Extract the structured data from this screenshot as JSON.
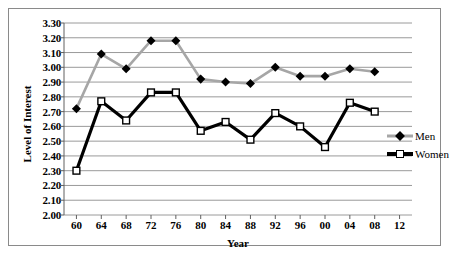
{
  "chart_data": {
    "type": "line",
    "title": "",
    "xlabel": "Year",
    "ylabel": "Level of Interest",
    "x": [
      60,
      64,
      68,
      72,
      76,
      80,
      84,
      88,
      92,
      96,
      0,
      4,
      8
    ],
    "tick_labels": [
      "60",
      "64",
      "68",
      "72",
      "76",
      "80",
      "84",
      "88",
      "92",
      "96",
      "00",
      "04",
      "08",
      "12"
    ],
    "y_ticks": [
      "2.00",
      "2.10",
      "2.20",
      "2.30",
      "2.40",
      "2.50",
      "2.60",
      "2.70",
      "2.80",
      "2.90",
      "3.00",
      "3.10",
      "3.20",
      "3.30"
    ],
    "ylim": [
      2.0,
      3.3
    ],
    "xlim": [
      58,
      14
    ],
    "grid": true,
    "legend_position": "right",
    "series": [
      {
        "name": "Men",
        "color": "#a6a6a6",
        "marker": "diamond",
        "values": [
          2.72,
          3.09,
          2.99,
          3.18,
          3.18,
          2.92,
          2.9,
          2.89,
          3.0,
          2.94,
          2.94,
          2.99,
          2.97
        ]
      },
      {
        "name": "Women",
        "color": "#000000",
        "marker": "square",
        "values": [
          2.3,
          2.77,
          2.64,
          2.83,
          2.83,
          2.57,
          2.63,
          2.51,
          2.69,
          2.6,
          2.46,
          2.76,
          2.7
        ]
      }
    ]
  },
  "legend": {
    "items": [
      {
        "label": "Men"
      },
      {
        "label": "Women"
      }
    ]
  }
}
